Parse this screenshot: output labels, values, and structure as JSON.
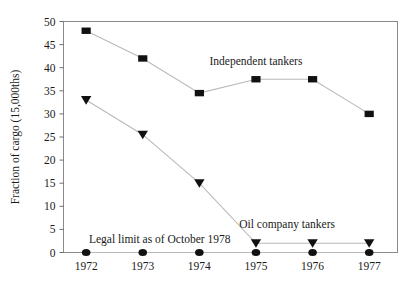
{
  "chart_data": {
    "type": "line",
    "title": "",
    "xlabel": "",
    "ylabel": "Fraction of cargo (15,000ths)",
    "categories": [
      "1972",
      "1973",
      "1974",
      "1975",
      "1976",
      "1977"
    ],
    "x": [
      1972,
      1973,
      1974,
      1975,
      1976,
      1977
    ],
    "ylim": [
      0,
      50
    ],
    "xlim": [
      1971.6,
      1977.5
    ],
    "yticks": [
      0,
      5,
      10,
      15,
      20,
      25,
      30,
      35,
      40,
      45,
      50
    ],
    "ytick_labels": [
      "0",
      "5",
      "10",
      "15",
      "20",
      "25",
      "30",
      "35",
      "40",
      "45",
      "50"
    ],
    "xtick_labels": [
      "1972",
      "1973",
      "1974",
      "1975",
      "1976",
      "1977"
    ],
    "grid": false,
    "legend_position": "inline-annotations",
    "series": [
      {
        "name": "Independent tankers",
        "marker": "square",
        "color": "#111111",
        "values": [
          48,
          42,
          34.5,
          37.5,
          37.5,
          30
        ]
      },
      {
        "name": "Oil company tankers",
        "marker": "triangle-down",
        "color": "#111111",
        "values": [
          33,
          25.5,
          15,
          2,
          2,
          2
        ]
      },
      {
        "name": "Legal limit as of October 1978",
        "marker": "circle",
        "color": "#111111",
        "values": [
          0,
          0,
          0,
          0,
          0,
          0
        ]
      }
    ],
    "annotations": [
      {
        "text": "Independent tankers",
        "x": 1975.0,
        "y": 40.5
      },
      {
        "text": "Oil company tankers",
        "x": 1975.55,
        "y": 5.4
      },
      {
        "text": "Legal limit as of October 1978",
        "x": 1972.05,
        "y": 2.1
      }
    ]
  },
  "axes": {
    "y_title": "Fraction of cargo (15,000ths)",
    "x_title": ""
  },
  "colors": {
    "marker": "#111111",
    "line": "#b9b9b9",
    "frame": "#8a8a8a",
    "text": "#1a1a1a",
    "background": "#ffffff"
  }
}
